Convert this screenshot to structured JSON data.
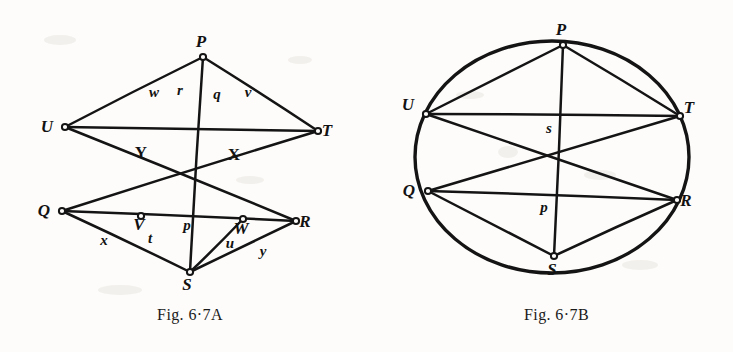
{
  "document": {
    "kind": "geometry-figure-pair",
    "ink_color": "#141414",
    "paper_color": "#fdfcfa"
  },
  "figure_a": {
    "caption": "Fig. 6·7A",
    "shape": "hexagon-with-diagonals",
    "vertices": [
      {
        "id": "P",
        "label": "P",
        "x": 203,
        "y": 57,
        "label_dx": -2,
        "label_dy": -10,
        "marker": "open-circle"
      },
      {
        "id": "U",
        "label": "U",
        "x": 65,
        "y": 127,
        "label_dx": -18,
        "label_dy": 5,
        "marker": "open-circle"
      },
      {
        "id": "T",
        "label": "T",
        "x": 318,
        "y": 131,
        "label_dx": 9,
        "label_dy": 5,
        "marker": "open-circle"
      },
      {
        "id": "Q",
        "label": "Q",
        "x": 62,
        "y": 211,
        "label_dx": -18,
        "label_dy": 5,
        "marker": "open-circle"
      },
      {
        "id": "R",
        "label": "R",
        "x": 296,
        "y": 221,
        "label_dx": 9,
        "label_dy": 6,
        "marker": "open-circle"
      },
      {
        "id": "S",
        "label": "S",
        "x": 190,
        "y": 272,
        "label_dx": -3,
        "label_dy": 18,
        "marker": "open-circle"
      }
    ],
    "interior_points": [
      {
        "id": "V",
        "label": "V",
        "x": 141,
        "y": 216,
        "label_dx": -2,
        "label_dy": 14,
        "marker": "open-circle"
      },
      {
        "id": "W",
        "label": "W",
        "x": 243,
        "y": 219,
        "label_dx": -2,
        "label_dy": 15,
        "marker": "open-circle"
      }
    ],
    "edges": [
      {
        "from": "U",
        "to": "P"
      },
      {
        "from": "P",
        "to": "T"
      },
      {
        "from": "U",
        "to": "T"
      },
      {
        "from": "Q",
        "to": "R"
      },
      {
        "from": "Q",
        "to": "S"
      },
      {
        "from": "S",
        "to": "R"
      },
      {
        "from": "P",
        "to": "S"
      },
      {
        "from": "U",
        "to": "R"
      },
      {
        "from": "Q",
        "to": "T"
      },
      {
        "from": "W",
        "to": "S"
      }
    ],
    "intersection_labels": [
      {
        "id": "X",
        "label": "X",
        "x": 234,
        "y": 160
      },
      {
        "id": "Y",
        "label": "Y",
        "x": 141,
        "y": 158
      }
    ],
    "segment_labels": [
      {
        "id": "w",
        "label": "w",
        "x": 154,
        "y": 97
      },
      {
        "id": "r",
        "label": "r",
        "x": 180,
        "y": 95
      },
      {
        "id": "q",
        "label": "q",
        "x": 217,
        "y": 99
      },
      {
        "id": "v",
        "label": "v",
        "x": 248,
        "y": 97
      },
      {
        "id": "x",
        "label": "x",
        "x": 104,
        "y": 245
      },
      {
        "id": "t",
        "label": "t",
        "x": 150,
        "y": 243
      },
      {
        "id": "p",
        "label": "p",
        "x": 187,
        "y": 230
      },
      {
        "id": "u",
        "label": "u",
        "x": 230,
        "y": 248
      },
      {
        "id": "y",
        "label": "y",
        "x": 263,
        "y": 256
      }
    ]
  },
  "figure_b": {
    "caption": "Fig. 6·7B",
    "shape": "ellipse-with-inscribed-hexagram",
    "ellipse": {
      "cx": 552,
      "cy": 157,
      "rx": 137,
      "ry": 116
    },
    "vertices": [
      {
        "id": "P",
        "label": "P",
        "x": 563,
        "y": 45,
        "label_dx": -2,
        "label_dy": -10,
        "marker": "open-circle"
      },
      {
        "id": "U",
        "label": "U",
        "x": 426,
        "y": 114,
        "label_dx": -18,
        "label_dy": -4,
        "marker": "open-circle"
      },
      {
        "id": "T",
        "label": "T",
        "x": 680,
        "y": 116,
        "label_dx": 9,
        "label_dy": -3,
        "marker": "open-circle"
      },
      {
        "id": "Q",
        "label": "Q",
        "x": 428,
        "y": 191,
        "label_dx": -19,
        "label_dy": 5,
        "marker": "open-circle"
      },
      {
        "id": "R",
        "label": "R",
        "x": 677,
        "y": 200,
        "label_dx": 9,
        "label_dy": 6,
        "marker": "open-circle"
      },
      {
        "id": "S",
        "label": "S",
        "x": 554,
        "y": 256,
        "label_dx": -2,
        "label_dy": 19,
        "marker": "open-circle"
      }
    ],
    "edges": [
      {
        "from": "U",
        "to": "P"
      },
      {
        "from": "P",
        "to": "T"
      },
      {
        "from": "U",
        "to": "T"
      },
      {
        "from": "Q",
        "to": "R"
      },
      {
        "from": "Q",
        "to": "S"
      },
      {
        "from": "S",
        "to": "R"
      },
      {
        "from": "P",
        "to": "S"
      },
      {
        "from": "U",
        "to": "R"
      },
      {
        "from": "Q",
        "to": "T"
      }
    ],
    "segment_labels": [
      {
        "id": "s",
        "label": "s",
        "x": 549,
        "y": 133
      },
      {
        "id": "p",
        "label": "p",
        "x": 544,
        "y": 212
      }
    ]
  }
}
